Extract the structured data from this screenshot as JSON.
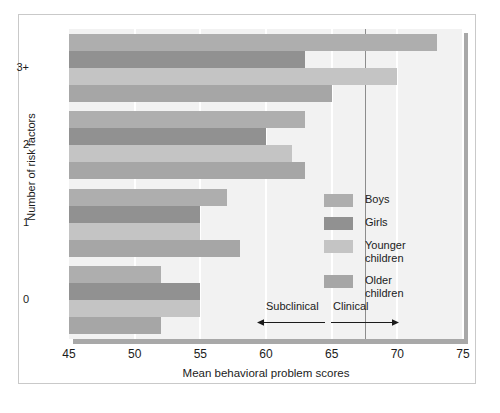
{
  "chart_data": {
    "type": "bar",
    "orientation": "horizontal",
    "title": "",
    "xlabel": "Mean behavioral problem scores",
    "ylabel": "Number of risk factors",
    "categories": [
      "3+",
      "2",
      "1",
      "0"
    ],
    "xlim": [
      45,
      75
    ],
    "xticks": [
      45,
      50,
      55,
      60,
      65,
      70,
      75
    ],
    "grid": true,
    "legend_position": "inside-right",
    "series": [
      {
        "name": "Boys",
        "color": "#aeaeae",
        "values": [
          73,
          63,
          57,
          52
        ]
      },
      {
        "name": "Girls",
        "color": "#919191",
        "values": [
          63,
          60,
          55,
          55
        ]
      },
      {
        "name": "Younger children",
        "color": "#c4c4c4",
        "values": [
          70,
          62,
          55,
          55
        ]
      },
      {
        "name": "Older children",
        "color": "#a6a6a6",
        "values": [
          65,
          63,
          58,
          52
        ]
      }
    ],
    "annotations": [
      {
        "name": "subclinical",
        "label": "Subclinical",
        "arrow": "left",
        "boundary": 67.5
      },
      {
        "name": "clinical",
        "label": "Clinical",
        "arrow": "right",
        "boundary": 67.5
      }
    ]
  },
  "legend": {
    "items": [
      {
        "label": "Boys",
        "lines": [
          "Boys"
        ]
      },
      {
        "label": "Girls",
        "lines": [
          "Girls"
        ]
      },
      {
        "label": "Younger children",
        "lines": [
          "Younger",
          "children"
        ]
      },
      {
        "label": "Older children",
        "lines": [
          "Older",
          "children"
        ]
      }
    ]
  },
  "colors": {
    "plot_background": "#f2f2f2",
    "gridline": "#ffffff",
    "divider": "#8d8d8d",
    "text": "#1b1b1b"
  }
}
